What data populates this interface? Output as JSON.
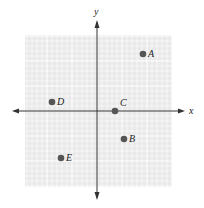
{
  "diagram": {
    "type": "coordinate-plane",
    "axes": {
      "x_label": "x",
      "y_label": "y"
    },
    "grid": {
      "left": 25,
      "right": 172,
      "top": 35,
      "bottom": 187,
      "cell": 5,
      "major_every": 5,
      "background": "#e9e9e9",
      "minor_color": "#ffffff",
      "major_color": "#ffffff"
    },
    "origin": {
      "x": 97,
      "y": 111
    },
    "point_color": "#555555",
    "axis_color": "#333333",
    "points": [
      {
        "label": "A",
        "px": 143,
        "py": 54,
        "dx": 5,
        "dy": 3
      },
      {
        "label": "B",
        "px": 124,
        "py": 139,
        "dx": 5,
        "dy": 3
      },
      {
        "label": "C",
        "px": 115,
        "py": 111,
        "dx": 5,
        "dy": -5
      },
      {
        "label": "D",
        "px": 52,
        "py": 102,
        "dx": 5,
        "dy": 3
      },
      {
        "label": "E",
        "px": 61,
        "py": 158,
        "dx": 5,
        "dy": 3
      }
    ]
  }
}
